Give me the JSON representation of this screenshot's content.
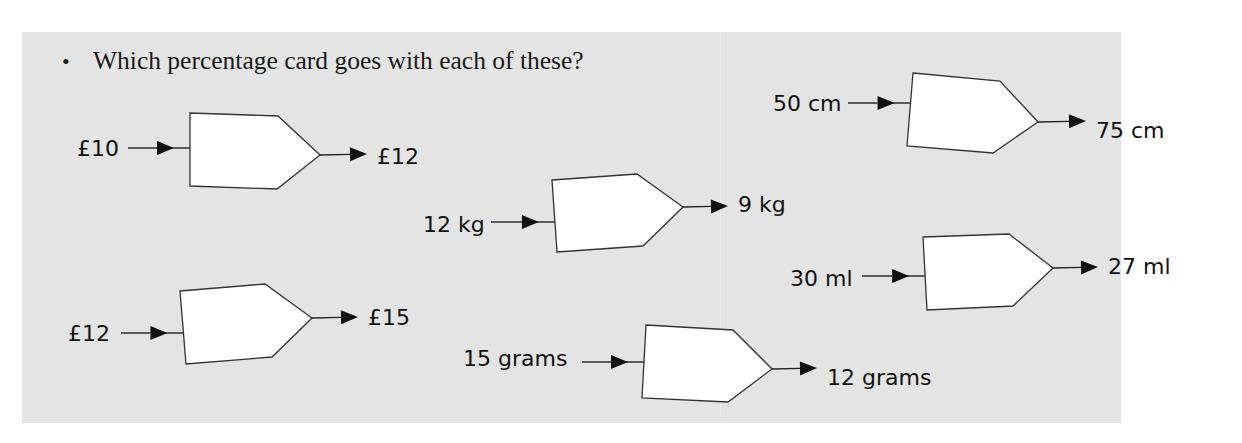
{
  "question": {
    "bullet": "•",
    "text": "Which percentage card goes with each of these?"
  },
  "cards": [
    {
      "input": "£10",
      "output": "£12",
      "in_x": 77,
      "in_y": 156,
      "line_x1": 128,
      "line_y": 148,
      "poly": "190,113 278,116 320,155 277,189 190,186",
      "out_line_x1": 320,
      "out_line_y1": 155,
      "out_x": 377,
      "out_y": 164
    },
    {
      "input": "12 kg",
      "output": "9 kg",
      "in_x": 423,
      "in_y": 232,
      "line_x1": 491,
      "line_y": 222,
      "poly": "552,180 637,174 683,207 643,246 557,252",
      "out_line_x1": 683,
      "out_line_y1": 207,
      "out_x": 738,
      "out_y": 212
    },
    {
      "input": "50 cm",
      "output": "75 cm",
      "in_x": 773,
      "in_y": 111,
      "line_x1": 848,
      "line_y": 103,
      "poly": "913,73 1000,81 1038,122 993,153 907,146",
      "out_line_x1": 1038,
      "out_line_y1": 122,
      "out_x": 1096,
      "out_y": 138
    },
    {
      "input": "30 ml",
      "output": "27 ml",
      "in_x": 790,
      "in_y": 286,
      "line_x1": 862,
      "line_y": 276,
      "poly": "923,237 1009,234 1053,268 1013,306 927,310",
      "out_line_x1": 1053,
      "out_line_y1": 268,
      "out_x": 1108,
      "out_y": 274
    },
    {
      "input": "£12",
      "output": "£15",
      "in_x": 68,
      "in_y": 341,
      "line_x1": 121,
      "line_y": 333,
      "poly": "180,291 265,284 312,318 272,357 186,364",
      "out_line_x1": 312,
      "out_line_y1": 318,
      "out_x": 368,
      "out_y": 325
    },
    {
      "input": "15 grams",
      "output": "12 grams",
      "in_x": 463,
      "in_y": 366,
      "line_x1": 582,
      "line_y": 362,
      "poly": "646,325 733,330 772,369 728,402 642,398",
      "out_line_x1": 772,
      "out_line_y1": 369,
      "out_x": 827,
      "out_y": 385
    }
  ],
  "colors": {
    "panel_background": "#e4e4e4",
    "card_fill": "#ffffff",
    "ink": "#111111"
  }
}
